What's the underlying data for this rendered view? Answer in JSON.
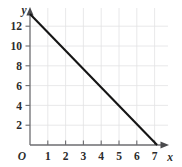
{
  "chart_data": {
    "type": "line",
    "title": "",
    "xlabel": "x",
    "ylabel": "y",
    "origin_label": "O",
    "grid": true,
    "legend": "none",
    "xlim": [
      0,
      7.6
    ],
    "ylim": [
      0,
      13.6
    ],
    "x_ticks": [
      1,
      2,
      3,
      4,
      5,
      6,
      7
    ],
    "x_tick_labels": [
      "1",
      "2",
      "3",
      "4",
      "5",
      "6",
      "7"
    ],
    "y_ticks": [
      2,
      4,
      6,
      8,
      10,
      12
    ],
    "y_tick_labels": [
      "2",
      "4",
      "6",
      "8",
      "10",
      "12"
    ],
    "series": [
      {
        "name": "line",
        "color": "#151515",
        "x": [
          0,
          7
        ],
        "y": [
          13,
          0
        ],
        "points": [
          [
            0,
            13
          ],
          [
            7,
            0
          ]
        ]
      }
    ]
  },
  "colors": {
    "grid": "#e2e2e4",
    "axis": "#6d6d70",
    "line": "#151515",
    "text": "#2b2b2b",
    "background": "#ffffff"
  }
}
